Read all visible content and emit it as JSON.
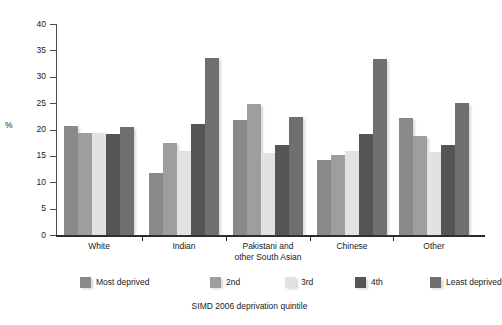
{
  "chart_data": {
    "type": "bar",
    "title": "",
    "xlabel": "SIMD 2006 deprivation quintile",
    "ylabel": "%",
    "ylim": [
      0,
      40
    ],
    "ytick_step": 5,
    "yticks": [
      "0",
      "5",
      "10",
      "15",
      "20",
      "25",
      "30",
      "35",
      "40"
    ],
    "grid": false,
    "legend_position": "bottom",
    "categories": [
      "White",
      "Indian",
      "Pakistani and other South Asian",
      "Chinese",
      "Other"
    ],
    "category_label_lines": [
      [
        "White"
      ],
      [
        "Indian"
      ],
      [
        "Pakistani and",
        "other South Asian"
      ],
      [
        "Chinese"
      ],
      [
        "Other"
      ]
    ],
    "series": [
      {
        "name": "Most deprived",
        "color": "#8a8a8a",
        "values": [
          20.6,
          11.8,
          21.8,
          14.2,
          22.2
        ]
      },
      {
        "name": "2nd",
        "color": "#9e9e9e",
        "values": [
          19.4,
          17.5,
          24.8,
          15.1,
          18.8
        ]
      },
      {
        "name": "3rd",
        "color": "#e2e2e2",
        "values": [
          19.3,
          15.9,
          15.6,
          16.0,
          15.8
        ]
      },
      {
        "name": "4th",
        "color": "#555555",
        "values": [
          19.1,
          21.1,
          17.1,
          19.1,
          17.0
        ]
      },
      {
        "name": "Least deprived",
        "color": "#6f6f6f",
        "values": [
          20.5,
          33.6,
          22.3,
          33.4,
          25.1
        ]
      }
    ]
  },
  "legend": {
    "items": [
      {
        "label": "Most deprived",
        "color": "#8a8a8a"
      },
      {
        "label": "2nd",
        "color": "#9e9e9e"
      },
      {
        "label": "3rd",
        "color": "#e2e2e2"
      },
      {
        "label": "4th",
        "color": "#555555"
      },
      {
        "label": "Least deprived",
        "color": "#6f6f6f"
      }
    ]
  }
}
